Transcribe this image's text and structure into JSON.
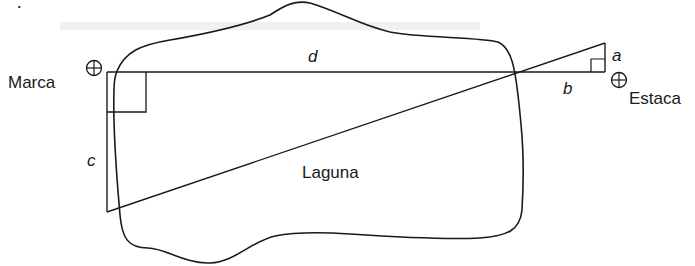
{
  "diagram": {
    "type": "geometry-figure",
    "caption_fragment": "espuesta",
    "region_label": "Laguna",
    "points": {
      "left_marker": {
        "label": "Marca",
        "icon": "circled-plus-icon"
      },
      "right_marker": {
        "label": "Estaca",
        "icon": "circled-plus-icon"
      }
    },
    "segments": {
      "a": "a",
      "b": "b",
      "c": "c",
      "d": "d"
    },
    "right_angle_marks": [
      "top-left corner (d,c)",
      "bottom-right corner (a,b)"
    ],
    "colors": {
      "stroke": "#1a1a1a",
      "background": "#ffffff"
    }
  }
}
